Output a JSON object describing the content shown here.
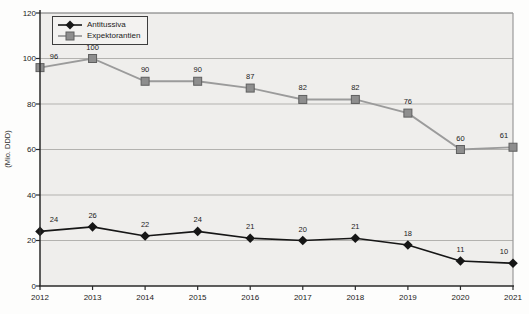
{
  "chart_data": {
    "type": "line",
    "title": "",
    "xlabel": "",
    "ylabel": "(Mio. DDD)",
    "x": [
      "2012",
      "2013",
      "2014",
      "2015",
      "2016",
      "2017",
      "2018",
      "2019",
      "2020",
      "2021"
    ],
    "series": [
      {
        "name": "Antitussiva",
        "marker": "diamond",
        "color": "#161616",
        "marker_border": "#161616",
        "values": [
          24,
          26,
          22,
          24,
          21,
          20,
          21,
          18,
          11,
          10
        ]
      },
      {
        "name": "Expektorantien",
        "marker": "square",
        "color": "#9b9b9b",
        "marker_fill": "#8e8e8e",
        "marker_border": "#5f5f5f",
        "values": [
          96,
          100,
          90,
          90,
          87,
          82,
          82,
          76,
          60,
          61
        ]
      }
    ],
    "ylim": [
      0,
      120
    ],
    "yticks": [
      0,
      20,
      40,
      60,
      80,
      100,
      120
    ],
    "grid": true,
    "data_labels": true,
    "legend_position": "top-left",
    "plot_background": "#efeeec",
    "grid_color": "#b3b2af",
    "axis_color": "#2a2a2a",
    "label_color": "#1b1b1b"
  }
}
